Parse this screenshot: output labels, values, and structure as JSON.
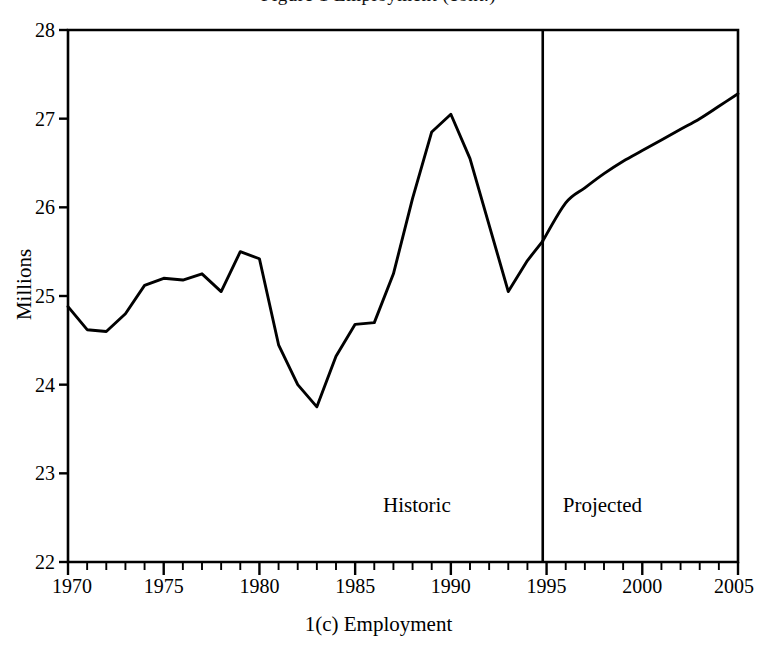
{
  "figure": {
    "clipped_title": "Figure 1  Employment (cont.)",
    "caption": "1(c)  Employment"
  },
  "annotations": {
    "historic": "Historic",
    "projected": "Projected"
  },
  "axes": {
    "y_label": "Millions",
    "y_ticks": [
      "22",
      "23",
      "24",
      "25",
      "26",
      "27",
      "28"
    ],
    "x_ticks": [
      "1970",
      "1975",
      "1980",
      "1985",
      "1990",
      "1995",
      "2000",
      "2005"
    ]
  },
  "colors": {
    "line": "#000000",
    "axis": "#000000",
    "background": "#ffffff",
    "divider": "#000000"
  },
  "chart_data": {
    "type": "line",
    "title": "1(c)  Employment",
    "xlabel": "",
    "ylabel": "Millions",
    "xlim": [
      1970,
      2005
    ],
    "ylim": [
      22,
      28
    ],
    "grid": false,
    "legend": null,
    "x_tick_values": [
      1970,
      1975,
      1980,
      1985,
      1990,
      1995,
      2000,
      2005
    ],
    "y_tick_values": [
      22,
      23,
      24,
      25,
      26,
      27,
      28
    ],
    "x_minor_tick_step": 1,
    "divider_x": 1994.8,
    "divider_label_left": "Historic",
    "divider_label_right": "Projected",
    "series": [
      {
        "name": "Employment (historic)",
        "segment": "historic",
        "x": [
          1970,
          1971,
          1972,
          1973,
          1974,
          1975,
          1976,
          1977,
          1978,
          1979,
          1980,
          1981,
          1982,
          1983,
          1984,
          1985,
          1986,
          1987,
          1988,
          1989,
          1990,
          1991,
          1992,
          1993,
          1994,
          1994.8
        ],
        "values": [
          24.88,
          24.62,
          24.6,
          24.8,
          25.12,
          25.2,
          25.18,
          25.25,
          25.05,
          25.5,
          25.42,
          24.45,
          24.0,
          23.75,
          24.32,
          24.68,
          24.7,
          25.25,
          26.1,
          26.85,
          27.05,
          26.55,
          25.8,
          25.05,
          25.4,
          25.62
        ]
      },
      {
        "name": "Employment (projected)",
        "segment": "projected",
        "x": [
          1994.8,
          1996,
          1997,
          1998,
          1999,
          2000,
          2001,
          2002,
          2003,
          2004,
          2005
        ],
        "values": [
          25.62,
          26.05,
          26.22,
          26.38,
          26.52,
          26.64,
          26.76,
          26.88,
          27.0,
          27.14,
          27.28
        ]
      }
    ]
  }
}
